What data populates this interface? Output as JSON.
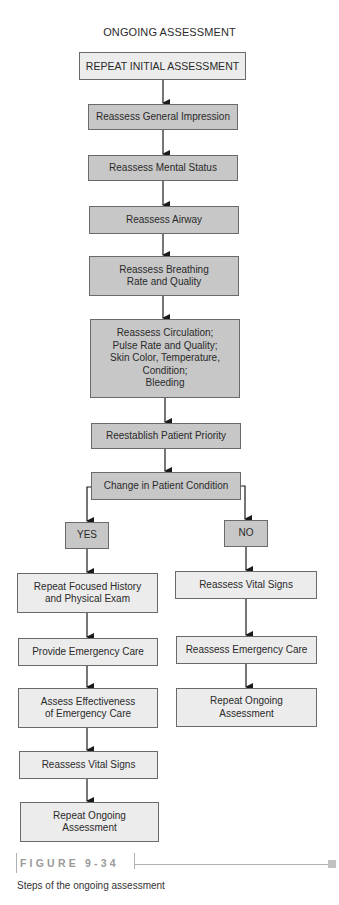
{
  "title": "ONGOING ASSESSMENT",
  "colors": {
    "box_light": "#ececec",
    "box_dark": "#c7c7c7",
    "border": "#6a6a6a",
    "arrow": "#1a1a1a",
    "figure_label": "#9a9a9a"
  },
  "main_flow": [
    {
      "id": "repeat-initial-assessment",
      "label": "REPEAT INITIAL ASSESSMENT",
      "shade": "light"
    },
    {
      "id": "reassess-general-impression",
      "label": "Reassess General Impression",
      "shade": "dark"
    },
    {
      "id": "reassess-mental-status",
      "label": "Reassess Mental Status",
      "shade": "dark"
    },
    {
      "id": "reassess-airway",
      "label": "Reassess Airway",
      "shade": "dark"
    },
    {
      "id": "reassess-breathing",
      "label": "Reassess Breathing\nRate and Quality",
      "shade": "dark"
    },
    {
      "id": "reassess-circulation",
      "label": "Reassess Circulation;\nPulse Rate and Quality;\nSkin Color, Temperature,\nCondition;\nBleeding",
      "shade": "dark"
    },
    {
      "id": "reestablish-patient-priority",
      "label": "Reestablish Patient Priority",
      "shade": "dark"
    },
    {
      "id": "change-in-patient-condition",
      "label": "Change in Patient Condition",
      "shade": "dark"
    }
  ],
  "decision": {
    "yes_label": "YES",
    "no_label": "NO"
  },
  "yes_branch": [
    {
      "id": "repeat-focused-history",
      "label": "Repeat Focused History\nand Physical Exam"
    },
    {
      "id": "provide-emergency-care",
      "label": "Provide Emergency Care"
    },
    {
      "id": "assess-effectiveness",
      "label": "Assess Effectiveness\nof Emergency Care"
    },
    {
      "id": "reassess-vital-signs-yes",
      "label": "Reassess Vital Signs"
    },
    {
      "id": "repeat-ongoing-assessment-yes",
      "label": "Repeat Ongoing\nAssessment"
    }
  ],
  "no_branch": [
    {
      "id": "reassess-vital-signs-no",
      "label": "Reassess Vital Signs"
    },
    {
      "id": "reassess-emergency-care",
      "label": "Reassess Emergency Care"
    },
    {
      "id": "repeat-ongoing-assessment-no",
      "label": "Repeat Ongoing\nAssessment"
    }
  ],
  "figure": {
    "label": "FIGURE 9-34",
    "caption": "Steps of the ongoing assessment"
  }
}
